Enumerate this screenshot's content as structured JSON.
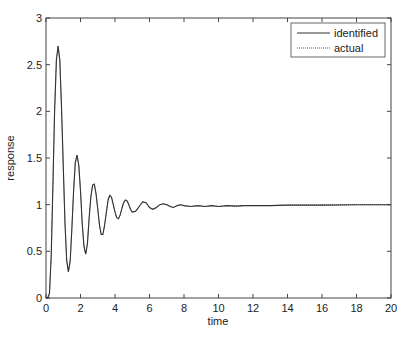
{
  "chart_data": {
    "type": "line",
    "title": "",
    "xlabel": "time",
    "ylabel": "response",
    "xlim": [
      0,
      20
    ],
    "ylim": [
      0,
      3
    ],
    "grid": false,
    "legend_position": "upper right",
    "x_ticks": [
      0,
      2,
      4,
      6,
      8,
      10,
      12,
      14,
      16,
      18,
      20
    ],
    "y_ticks": [
      0,
      0.5,
      1,
      1.5,
      2,
      2.5,
      3
    ],
    "legend": [
      "identified",
      "actual"
    ],
    "series": [
      {
        "name": "identified",
        "style": "solid",
        "x": [
          0,
          0.1,
          0.2,
          0.3,
          0.4,
          0.5,
          0.6,
          0.7,
          0.8,
          0.9,
          1.0,
          1.1,
          1.2,
          1.3,
          1.4,
          1.5,
          1.6,
          1.7,
          1.8,
          1.9,
          2.0,
          2.1,
          2.2,
          2.3,
          2.4,
          2.5,
          2.6,
          2.7,
          2.8,
          2.9,
          3.0,
          3.1,
          3.2,
          3.3,
          3.4,
          3.5,
          3.6,
          3.7,
          3.8,
          3.9,
          4.0,
          4.1,
          4.2,
          4.3,
          4.4,
          4.5,
          4.6,
          4.7,
          4.8,
          4.9,
          5.0,
          5.2,
          5.4,
          5.6,
          5.8,
          6.0,
          6.2,
          6.4,
          6.6,
          6.8,
          7.0,
          7.2,
          7.4,
          7.6,
          7.8,
          8.0,
          8.4,
          8.8,
          9.2,
          9.6,
          10,
          10.5,
          11,
          11.5,
          12,
          13,
          14,
          16,
          18,
          20
        ],
        "y": [
          0,
          0.0,
          0.05,
          0.45,
          1.2,
          2.0,
          2.55,
          2.7,
          2.55,
          2.05,
          1.4,
          0.8,
          0.4,
          0.28,
          0.4,
          0.75,
          1.15,
          1.45,
          1.53,
          1.42,
          1.15,
          0.8,
          0.55,
          0.47,
          0.58,
          0.85,
          1.08,
          1.21,
          1.22,
          1.12,
          0.95,
          0.78,
          0.68,
          0.68,
          0.78,
          0.92,
          1.05,
          1.1,
          1.08,
          1.0,
          0.92,
          0.86,
          0.85,
          0.89,
          0.96,
          1.02,
          1.05,
          1.04,
          1.0,
          0.95,
          0.92,
          0.93,
          0.98,
          1.03,
          1.02,
          0.97,
          0.95,
          0.97,
          1.0,
          1.01,
          1.0,
          0.98,
          0.97,
          0.99,
          1.0,
          0.99,
          0.98,
          0.99,
          0.98,
          0.99,
          0.98,
          0.99,
          0.985,
          0.99,
          0.99,
          0.99,
          0.995,
          0.995,
          1.0,
          1.0
        ]
      },
      {
        "name": "actual",
        "style": "dotted",
        "x": [
          0,
          0.1,
          0.2,
          0.3,
          0.4,
          0.5,
          0.6,
          0.7,
          0.8,
          0.9,
          1.0,
          1.1,
          1.2,
          1.3,
          1.4,
          1.5,
          1.6,
          1.7,
          1.8,
          1.9,
          2.0,
          2.1,
          2.2,
          2.3,
          2.4,
          2.5,
          2.6,
          2.7,
          2.8,
          2.9,
          3.0,
          3.1,
          3.2,
          3.3,
          3.4,
          3.5,
          3.6,
          3.7,
          3.8,
          3.9,
          4.0,
          4.1,
          4.2,
          4.3,
          4.4,
          4.5,
          4.6,
          4.7,
          4.8,
          4.9,
          5.0,
          5.2,
          5.4,
          5.6,
          5.8,
          6.0,
          6.2,
          6.4,
          6.6,
          6.8,
          7.0,
          7.2,
          7.4,
          7.6,
          7.8,
          8.0,
          8.4,
          8.8,
          9.2,
          9.6,
          10,
          10.5,
          11,
          11.5,
          12,
          13,
          14,
          16,
          18,
          20
        ],
        "y": [
          0,
          0.0,
          0.05,
          0.45,
          1.2,
          2.0,
          2.55,
          2.7,
          2.55,
          2.05,
          1.4,
          0.8,
          0.4,
          0.28,
          0.4,
          0.75,
          1.15,
          1.45,
          1.53,
          1.42,
          1.15,
          0.8,
          0.55,
          0.47,
          0.58,
          0.85,
          1.08,
          1.21,
          1.22,
          1.12,
          0.95,
          0.78,
          0.68,
          0.68,
          0.78,
          0.92,
          1.05,
          1.1,
          1.08,
          1.0,
          0.92,
          0.86,
          0.85,
          0.89,
          0.96,
          1.02,
          1.05,
          1.04,
          1.0,
          0.95,
          0.92,
          0.93,
          0.98,
          1.03,
          1.02,
          0.97,
          0.95,
          0.97,
          1.0,
          1.01,
          1.0,
          0.98,
          0.97,
          0.99,
          1.0,
          0.99,
          0.98,
          0.99,
          0.98,
          0.99,
          0.98,
          0.99,
          0.985,
          0.99,
          0.99,
          0.99,
          0.995,
          0.995,
          1.0,
          1.0
        ]
      }
    ]
  },
  "colors": {
    "line": "#333333",
    "axes": "#444444",
    "background": "#ffffff"
  }
}
